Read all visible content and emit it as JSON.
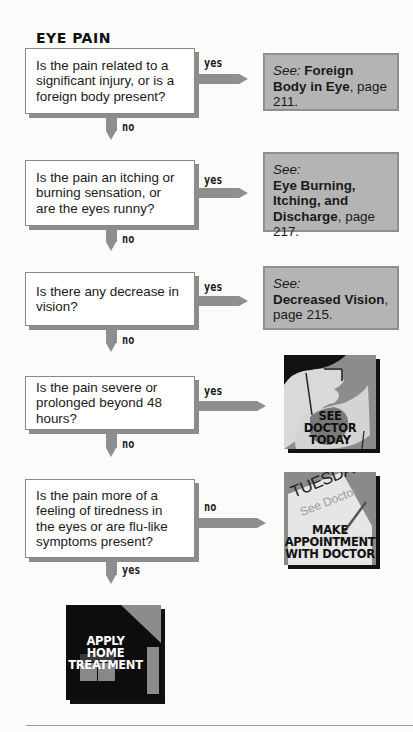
{
  "title": "EYE PAIN",
  "nodes": [
    {
      "question": "Is the pain related to a significant injury, or is a foreign body present?",
      "yes_label": "yes",
      "no_label": "no",
      "ref": {
        "see": "See:",
        "topic": "Foreign Body in Eye",
        "page": ", page 211."
      }
    },
    {
      "question": "Is the pain an itching or burning sensation, or are the eyes runny?",
      "yes_label": "yes",
      "no_label": "no",
      "ref": {
        "see": "See:",
        "topic": "Eye Burning, Itching, and Discharge",
        "page": ", page 217."
      }
    },
    {
      "question": "Is there any decrease in vision?",
      "yes_label": "yes",
      "no_label": "no",
      "ref": {
        "see": "See:",
        "topic": "Decreased Vision",
        "page": ", page 215."
      }
    },
    {
      "question": "Is the pain severe or prolonged beyond 48 hours?",
      "yes_label": "yes",
      "no_label": "no",
      "outcome": {
        "lines": [
          "SEE",
          "DOCTOR",
          "TODAY"
        ],
        "icon": "doctor-illustration"
      }
    },
    {
      "question": "Is the pain more of a feeling of tiredness in the eyes or are flu-like symptoms present?",
      "branch_label": "no",
      "down_label": "yes",
      "outcome": {
        "calendar_day": "TUESDAY",
        "calendar_note": "See Doctor",
        "lines": [
          "MAKE",
          "APPOINTMENT",
          "WITH DOCTOR"
        ],
        "icon": "calendar-illustration"
      }
    }
  ],
  "final": {
    "lines": [
      "APPLY",
      "HOME",
      "TREATMENT"
    ],
    "icon": "house-illustration"
  },
  "colors": {
    "arrow": "#8e8e8e",
    "ref_box": "#b4b4b4",
    "dark": "#111111"
  }
}
